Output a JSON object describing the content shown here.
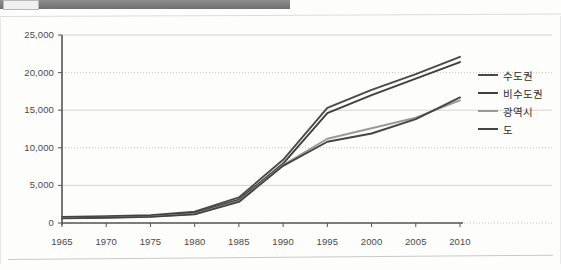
{
  "header": {
    "chip_label": "",
    "strip_name": "title-bar-strip"
  },
  "chart_data": {
    "type": "line",
    "title": "",
    "subtitle": "",
    "xlabel": "",
    "ylabel": "",
    "grid": true,
    "legend_position": "right",
    "categories": [
      "1965",
      "1970",
      "1975",
      "1980",
      "1985",
      "1990",
      "1995",
      "2000",
      "2005",
      "2010"
    ],
    "x": [
      1965,
      1970,
      1975,
      1980,
      1985,
      1990,
      1995,
      2000,
      2005,
      2010
    ],
    "xlim": [
      1965,
      2010
    ],
    "ylim": [
      0,
      25000
    ],
    "ytick_labels": [
      "25,000",
      "20,000",
      "15,000",
      "10,000",
      "5,000",
      "0"
    ],
    "ytick_values": [
      25000,
      20000,
      15000,
      10000,
      5000,
      0
    ],
    "series": [
      {
        "name": "수도권",
        "color": "#4a4a4a",
        "values": [
          800,
          900,
          1050,
          1500,
          3400,
          8400,
          15300,
          17700,
          19800,
          22100
        ]
      },
      {
        "name": "비수도권",
        "color": "#3f3f3f",
        "values": [
          700,
          800,
          950,
          1350,
          3100,
          7900,
          14600,
          17000,
          19200,
          21400
        ]
      },
      {
        "name": "광역시",
        "color": "#9a9a9a",
        "values": [
          650,
          720,
          850,
          1200,
          2900,
          7700,
          11200,
          12600,
          14000,
          16300
        ]
      },
      {
        "name": "도",
        "color": "#454545",
        "values": [
          620,
          700,
          820,
          1150,
          2800,
          7600,
          10800,
          11900,
          13800,
          16700
        ]
      }
    ]
  },
  "colors": {
    "grid_solid": "#c9c9c9",
    "grid_dotted": "#bdbdbd",
    "axis": "#555555",
    "tick_text": "#4a4a4a",
    "page_background": "#fdfdfc",
    "header_bar": "#7d7d7d"
  }
}
